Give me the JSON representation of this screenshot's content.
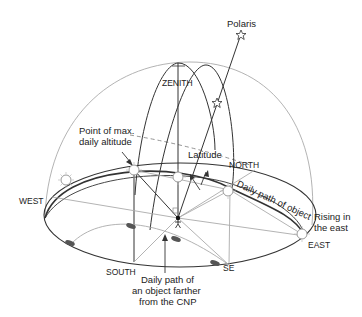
{
  "diagram": {
    "labels": {
      "polaris": "Polaris",
      "zenith": "ZENITH",
      "point_max_line1": "Point of max.",
      "point_max_line2": "daily altitude",
      "latitude": "Latitude",
      "north": "NORTH",
      "west": "WEST",
      "daily_path_object": "Daily path of object",
      "rising_line1": "Rising in",
      "rising_line2": "the east",
      "east": "EAST",
      "south": "SOUTH",
      "se": "SE",
      "farther_line1": "Daily path of",
      "farther_line2": "an object farther",
      "farther_line3": "from the CNP"
    },
    "colors": {
      "line_dark": "#333333",
      "line_light": "#aaaaaa",
      "background": "#ffffff"
    },
    "icons": [
      "star-icon",
      "sun-icon",
      "observer-icon",
      "cloud-icon"
    ]
  }
}
